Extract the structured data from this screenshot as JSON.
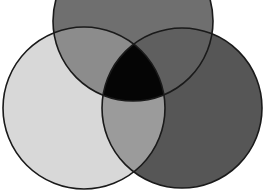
{
  "diagram": {
    "type": "venn",
    "sets": 3,
    "labels": [],
    "circles": [
      {
        "id": "top",
        "cx": 133,
        "cy": 21,
        "r": 80,
        "fill": "#6f6f6f"
      },
      {
        "id": "left",
        "cx": 84,
        "cy": 108,
        "r": 81,
        "fill": "#d8d8d8"
      },
      {
        "id": "right",
        "cx": 182,
        "cy": 108,
        "r": 80,
        "fill": "#565656"
      }
    ],
    "region_colors": {
      "top_left": "#8c8c8c",
      "top_right": "#5f5f5f",
      "left_right": "#9b9b9b",
      "center": "#050505"
    },
    "stroke": "#1a1a1a"
  }
}
